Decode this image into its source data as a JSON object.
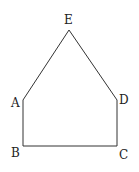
{
  "diagram": {
    "type": "pentagon",
    "stroke_color": "#333333",
    "vertices": [
      {
        "id": "E",
        "label": "E",
        "x": 69,
        "y": 30
      },
      {
        "id": "D",
        "label": "D",
        "x": 117,
        "y": 100
      },
      {
        "id": "C",
        "label": "C",
        "x": 117,
        "y": 146
      },
      {
        "id": "B",
        "label": "B",
        "x": 23,
        "y": 146
      },
      {
        "id": "A",
        "label": "A",
        "x": 23,
        "y": 100
      }
    ],
    "labels": {
      "E": "E",
      "A": "A",
      "D": "D",
      "B": "B",
      "C": "C"
    }
  }
}
